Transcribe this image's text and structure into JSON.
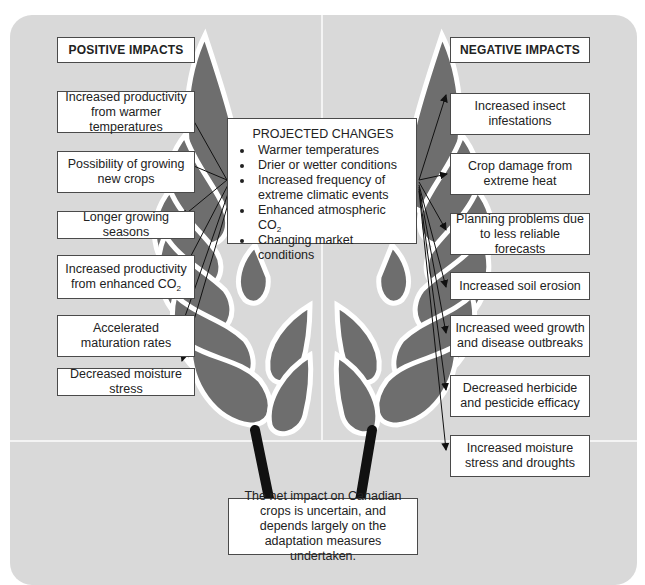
{
  "diagram": {
    "colors": {
      "panel_background": "#d9d9d9",
      "leaf_fill": "#6e6e6e",
      "leaf_outline": "#ffffff",
      "stem": "#111111",
      "box_fill": "#ffffff",
      "box_border": "#4a4a4a",
      "arrow": "#111111"
    },
    "positive": {
      "heading": "POSITIVE IMPACTS",
      "items": [
        {
          "label": "Increased productivity from warmer temperatures"
        },
        {
          "label": "Possibility of growing new crops"
        },
        {
          "label": "Longer growing seasons"
        },
        {
          "label": "Increased productivity from enhanced CO",
          "subscript": "2"
        },
        {
          "label": "Accelerated maturation rates"
        },
        {
          "label": "Decreased moisture stress"
        }
      ]
    },
    "negative": {
      "heading": "NEGATIVE IMPACTS",
      "items": [
        {
          "label": "Increased insect infestations"
        },
        {
          "label": "Crop damage from extreme heat"
        },
        {
          "label": "Planning problems due to less reliable forecasts"
        },
        {
          "label": "Increased soil erosion"
        },
        {
          "label": "Increased weed growth and disease outbreaks"
        },
        {
          "label": "Decreased herbicide and pesticide efficacy"
        },
        {
          "label": "Increased moisture stress and droughts"
        }
      ]
    },
    "projected_changes": {
      "title": "PROJECTED CHANGES",
      "items": [
        {
          "label": "Warmer temperatures"
        },
        {
          "label": "Drier or wetter conditions"
        },
        {
          "label": "Increased frequency of extreme climatic events"
        },
        {
          "label": "Enhanced atmospheric CO",
          "subscript": "2"
        },
        {
          "label": "Changing market conditions"
        }
      ]
    },
    "conclusion": "The net impact on Canadian crops is uncertain, and depends largely on the adaptation measures undertaken."
  }
}
